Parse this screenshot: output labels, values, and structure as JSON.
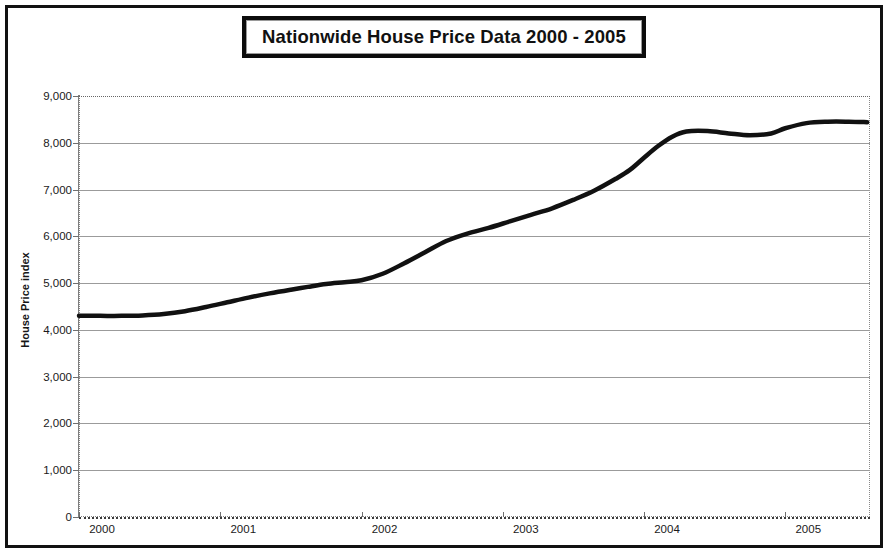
{
  "chart_data": {
    "type": "line",
    "title": "Nationwide House Price Data 2000 - 2005",
    "xlabel": "",
    "ylabel": "House Price index",
    "ylim": [
      0,
      9000
    ],
    "xlim": [
      2000,
      2005.6
    ],
    "grid": true,
    "legend": "none",
    "y_ticks": [
      "0",
      "1,000",
      "2,000",
      "3,000",
      "4,000",
      "5,000",
      "6,000",
      "7,000",
      "8,000",
      "9,000"
    ],
    "y_tick_values": [
      0,
      1000,
      2000,
      3000,
      4000,
      5000,
      6000,
      7000,
      8000,
      9000
    ],
    "x_ticks": [
      "2000",
      "2001",
      "2002",
      "2003",
      "2004",
      "2005"
    ],
    "x_tick_values": [
      2000,
      2001,
      2002,
      2003,
      2004,
      2005
    ],
    "series": [
      {
        "name": "House Price index",
        "color": "#111111",
        "x": [
          2000.0,
          2000.15,
          2000.3,
          2000.45,
          2000.6,
          2000.75,
          2000.9,
          2001.05,
          2001.2,
          2001.35,
          2001.5,
          2001.62,
          2001.75,
          2001.88,
          2002.0,
          2002.15,
          2002.3,
          2002.45,
          2002.6,
          2002.75,
          2002.9,
          2003.05,
          2003.2,
          2003.35,
          2003.5,
          2003.65,
          2003.8,
          2003.9,
          2004.0,
          2004.1,
          2004.2,
          2004.3,
          2004.45,
          2004.6,
          2004.75,
          2004.9,
          2005.0,
          2005.15,
          2005.3,
          2005.45,
          2005.58
        ],
        "values": [
          4300,
          4300,
          4300,
          4310,
          4340,
          4400,
          4490,
          4590,
          4690,
          4780,
          4860,
          4920,
          4980,
          5020,
          5060,
          5200,
          5420,
          5660,
          5900,
          6060,
          6180,
          6320,
          6460,
          6600,
          6780,
          6980,
          7230,
          7420,
          7680,
          7930,
          8130,
          8240,
          8250,
          8200,
          8160,
          8200,
          8310,
          8420,
          8450,
          8450,
          8440
        ]
      }
    ]
  }
}
